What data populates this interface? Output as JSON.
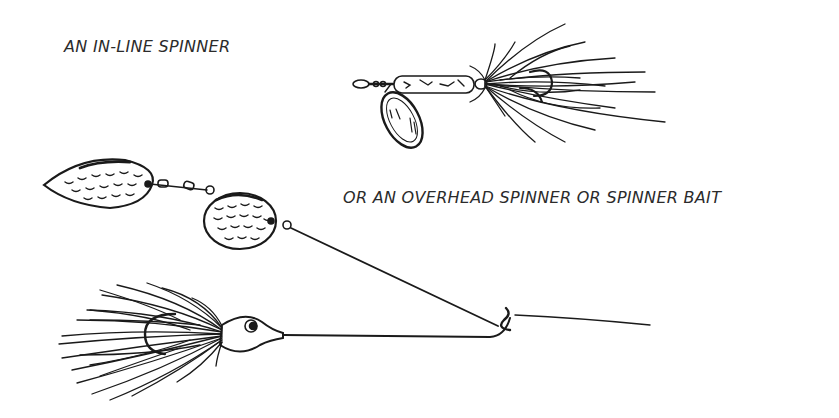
{
  "labels": {
    "inline_spinner": "AN IN-LINE SPINNER",
    "overhead_spinner": "OR AN OVERHEAD SPINNER OR SPINNER BAIT"
  },
  "illustrations": [
    {
      "name": "in-line-spinner",
      "parts": [
        "swivel-eye",
        "body",
        "oval-blade",
        "hair-tail"
      ]
    },
    {
      "name": "spinner-bait",
      "parts": [
        "willow-blade",
        "colorado-blade",
        "upper-wire-arm",
        "lead-head",
        "skirt",
        "hook",
        "lower-wire-arm",
        "line-tie",
        "fishing-line"
      ]
    }
  ],
  "colors": {
    "ink": "#1a1a1a",
    "background": "#ffffff"
  }
}
